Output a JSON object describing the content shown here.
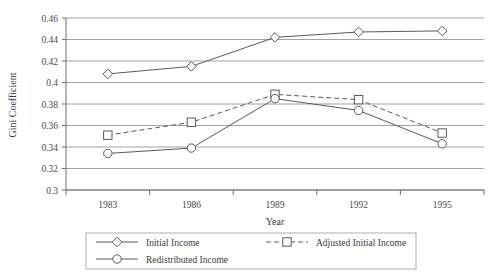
{
  "chart_data": {
    "type": "line",
    "title": "",
    "xlabel": "Year",
    "ylabel": "Gini Coefficient",
    "categories": [
      "1983",
      "1986",
      "1989",
      "1992",
      "1995"
    ],
    "x_tick_labels": [
      "1983",
      "1986",
      "1989",
      "1992",
      "1995"
    ],
    "y_tick_labels": [
      "0.3",
      "0.32",
      "0.34",
      "0.36",
      "0.38",
      "0.4",
      "0.42",
      "0.44",
      "0.46"
    ],
    "y_ticks": [
      0.3,
      0.32,
      0.34,
      0.36,
      0.38,
      0.4,
      0.42,
      0.44,
      0.46
    ],
    "ylim": [
      0.3,
      0.46
    ],
    "grid": "horizontal",
    "legend_position": "bottom",
    "series": [
      {
        "name": "Initial Income",
        "marker": "diamond",
        "linestyle": "solid",
        "values": [
          0.408,
          0.415,
          0.442,
          0.447,
          0.448
        ]
      },
      {
        "name": "Adjusted Initial Income",
        "marker": "square",
        "linestyle": "dashed",
        "values": [
          0.351,
          0.363,
          0.389,
          0.384,
          0.353
        ]
      },
      {
        "name": "Redistributed Income",
        "marker": "circle",
        "linestyle": "solid",
        "values": [
          0.334,
          0.339,
          0.385,
          0.374,
          0.343
        ]
      }
    ]
  },
  "legend": {
    "entries": [
      {
        "label": "Initial Income"
      },
      {
        "label": "Adjusted Initial Income"
      },
      {
        "label": "Redistributed Income"
      }
    ]
  }
}
